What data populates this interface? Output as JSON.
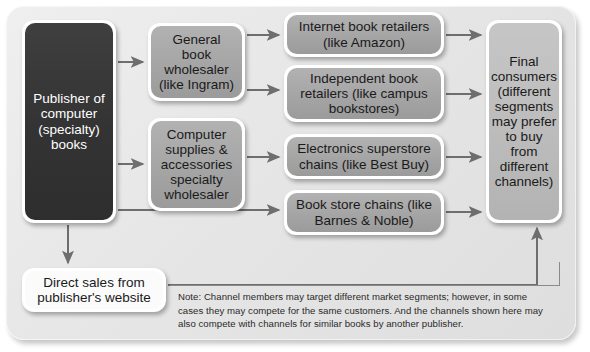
{
  "diagram": {
    "type": "flow-diagram",
    "accent_colors": {
      "panel_background": "#e6e6e6",
      "source_node": "#333333",
      "intermediary_node": "#a6a6a6",
      "destination_node": "#bcbcbc",
      "direct_node": "#fbfbfb",
      "connector": "#6e6e6e"
    },
    "nodes": {
      "publisher": "Publisher of computer (specialty) books",
      "wholesaler_general": "General book wholesaler (like Ingram)",
      "wholesaler_specialty": "Computer supplies & accessories specialty wholesaler",
      "retailer_internet": "Internet book retailers (like Amazon)",
      "retailer_independent": "Independent book retailers (like campus bookstores)",
      "retailer_electronics": "Electronics superstore chains (like Best Buy)",
      "retailer_bookstore": "Book store chains (like Barnes & Noble)",
      "final_consumers": "Final consumers (different segments may prefer to buy from different channels)",
      "direct_sales": "Direct sales from publisher's website"
    },
    "note": "Note: Channel members may target different market segments; however, in some cases they may compete for the same customers. And the channels shown here may also compete with channels for similar books by another publisher."
  }
}
